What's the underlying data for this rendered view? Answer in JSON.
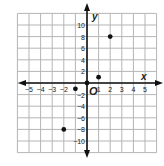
{
  "chart_data": {
    "type": "scatter",
    "title": "",
    "xlabel": "x",
    "ylabel": "y",
    "origin_label": "O",
    "xlim": [
      -6,
      6
    ],
    "ylim": [
      -12,
      12
    ],
    "grid": true,
    "x_ticks": [
      -5,
      -4,
      -3,
      -2,
      1,
      2,
      3,
      4,
      5
    ],
    "x_tick_labels": [
      "−5",
      "−4",
      "−3",
      "−2",
      "1",
      "2",
      "3",
      "4",
      "5"
    ],
    "y_ticks": [
      10,
      8,
      6,
      4,
      2,
      -2,
      -4,
      -6,
      -8,
      -10
    ],
    "y_tick_labels": [
      "10",
      "8",
      "6",
      "4",
      "2",
      "−2",
      "−4",
      "−6",
      "−8",
      "−10"
    ],
    "points": [
      {
        "x": 0,
        "y": 0
      },
      {
        "x": 1,
        "y": 1
      },
      {
        "x": 2,
        "y": 8
      },
      {
        "x": -1,
        "y": -1
      },
      {
        "x": -2,
        "y": -8
      }
    ],
    "colors": {
      "grid": "#b5b5b5",
      "axis": "#111111",
      "point": "#111111",
      "text": "#222222"
    }
  }
}
